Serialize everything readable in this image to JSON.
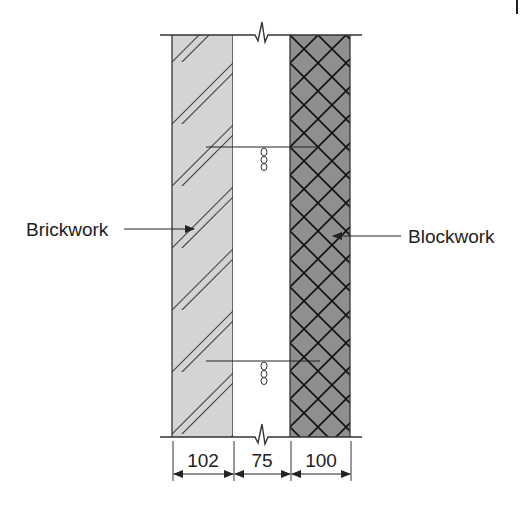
{
  "labels": {
    "left": "Brickwork",
    "right": "Blockwork"
  },
  "layers": [
    {
      "name": "brickwork",
      "thickness": "102",
      "fill": "#d4d4d4",
      "hatch": "diagonal-double"
    },
    {
      "name": "cavity",
      "thickness": "75",
      "fill": "#ffffff",
      "hatch": "none"
    },
    {
      "name": "blockwork",
      "thickness": "100",
      "fill": "#8f8f8f",
      "hatch": "crosshatch"
    }
  ],
  "dimensions": [
    "102",
    "75",
    "100"
  ],
  "wall_ties": 2,
  "colors": {
    "line": "#333333",
    "brick_fill": "#d4d4d4",
    "block_fill": "#8f8f8f"
  }
}
